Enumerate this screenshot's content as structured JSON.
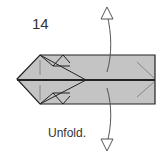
{
  "step_number": "14",
  "caption": "Unfold.",
  "colors": {
    "paper": "#c4c4c4",
    "outline": "#222222",
    "arrow": "#555555"
  },
  "icons": {
    "unfold-arrow": "double-headed curved arrow (up and down)"
  }
}
